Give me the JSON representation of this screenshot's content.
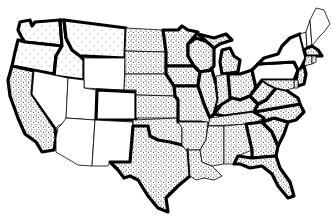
{
  "map": {
    "title": "",
    "type": "choropleth-stipple",
    "region": "Contiguous United States",
    "colors": {
      "border": "#000000",
      "background": "#ffffff",
      "unshaded": "#ffffff",
      "stipple_dot": "#000000"
    },
    "categories": [
      {
        "name": "stippled",
        "states": [
          "CA",
          "ND",
          "SD",
          "NE",
          "KS",
          "OK",
          "TX",
          "MN",
          "IA",
          "MO",
          "AR",
          "LA",
          "WI",
          "IL",
          "MI",
          "IN",
          "OH",
          "KY",
          "TN",
          "MS",
          "AL",
          "GA",
          "FL",
          "SC",
          "NC",
          "VA",
          "WV",
          "PA",
          "MD",
          "DE",
          "NJ",
          "CT",
          "RI",
          "MA"
        ]
      },
      {
        "name": "unshaded",
        "states": [
          "WA",
          "OR",
          "ID",
          "MT",
          "WY",
          "NV",
          "UT",
          "CO",
          "AZ",
          "NM",
          "NY",
          "VT",
          "NH",
          "ME"
        ]
      }
    ],
    "states": [
      {
        "id": "WA",
        "shade": "light"
      },
      {
        "id": "OR",
        "shade": "light"
      },
      {
        "id": "CA",
        "shade": "stipple"
      },
      {
        "id": "ID",
        "shade": "light"
      },
      {
        "id": "NV",
        "shade": "none"
      },
      {
        "id": "MT",
        "shade": "light"
      },
      {
        "id": "WY",
        "shade": "none"
      },
      {
        "id": "UT",
        "shade": "none"
      },
      {
        "id": "CO",
        "shade": "none"
      },
      {
        "id": "AZ",
        "shade": "none"
      },
      {
        "id": "NM",
        "shade": "none"
      },
      {
        "id": "ND",
        "shade": "stipple"
      },
      {
        "id": "SD",
        "shade": "stipple"
      },
      {
        "id": "NE",
        "shade": "stipple"
      },
      {
        "id": "KS",
        "shade": "stipple"
      },
      {
        "id": "OK",
        "shade": "stipple"
      },
      {
        "id": "TX",
        "shade": "stipple"
      },
      {
        "id": "MN",
        "shade": "stipple"
      },
      {
        "id": "IA",
        "shade": "stipple"
      },
      {
        "id": "MO",
        "shade": "stipple"
      },
      {
        "id": "AR",
        "shade": "stipple"
      },
      {
        "id": "LA",
        "shade": "stipple"
      },
      {
        "id": "WI",
        "shade": "stipple"
      },
      {
        "id": "IL",
        "shade": "stipple"
      },
      {
        "id": "MI",
        "shade": "stipple"
      },
      {
        "id": "IN",
        "shade": "stipple"
      },
      {
        "id": "OH",
        "shade": "stipple"
      },
      {
        "id": "KY",
        "shade": "stipple"
      },
      {
        "id": "TN",
        "shade": "stipple"
      },
      {
        "id": "MS",
        "shade": "stipple"
      },
      {
        "id": "AL",
        "shade": "stipple"
      },
      {
        "id": "GA",
        "shade": "stipple"
      },
      {
        "id": "FL",
        "shade": "stipple"
      },
      {
        "id": "SC",
        "shade": "stipple"
      },
      {
        "id": "NC",
        "shade": "stipple"
      },
      {
        "id": "VA",
        "shade": "stipple"
      },
      {
        "id": "WV",
        "shade": "stipple"
      },
      {
        "id": "PA",
        "shade": "none"
      },
      {
        "id": "NY",
        "shade": "none"
      },
      {
        "id": "VT",
        "shade": "none"
      },
      {
        "id": "NH",
        "shade": "none"
      },
      {
        "id": "ME",
        "shade": "none"
      },
      {
        "id": "MA",
        "shade": "stipple"
      },
      {
        "id": "CT",
        "shade": "stipple"
      },
      {
        "id": "RI",
        "shade": "stipple"
      },
      {
        "id": "NJ",
        "shade": "stipple"
      },
      {
        "id": "DE",
        "shade": "stipple"
      },
      {
        "id": "MD",
        "shade": "stipple"
      }
    ]
  }
}
